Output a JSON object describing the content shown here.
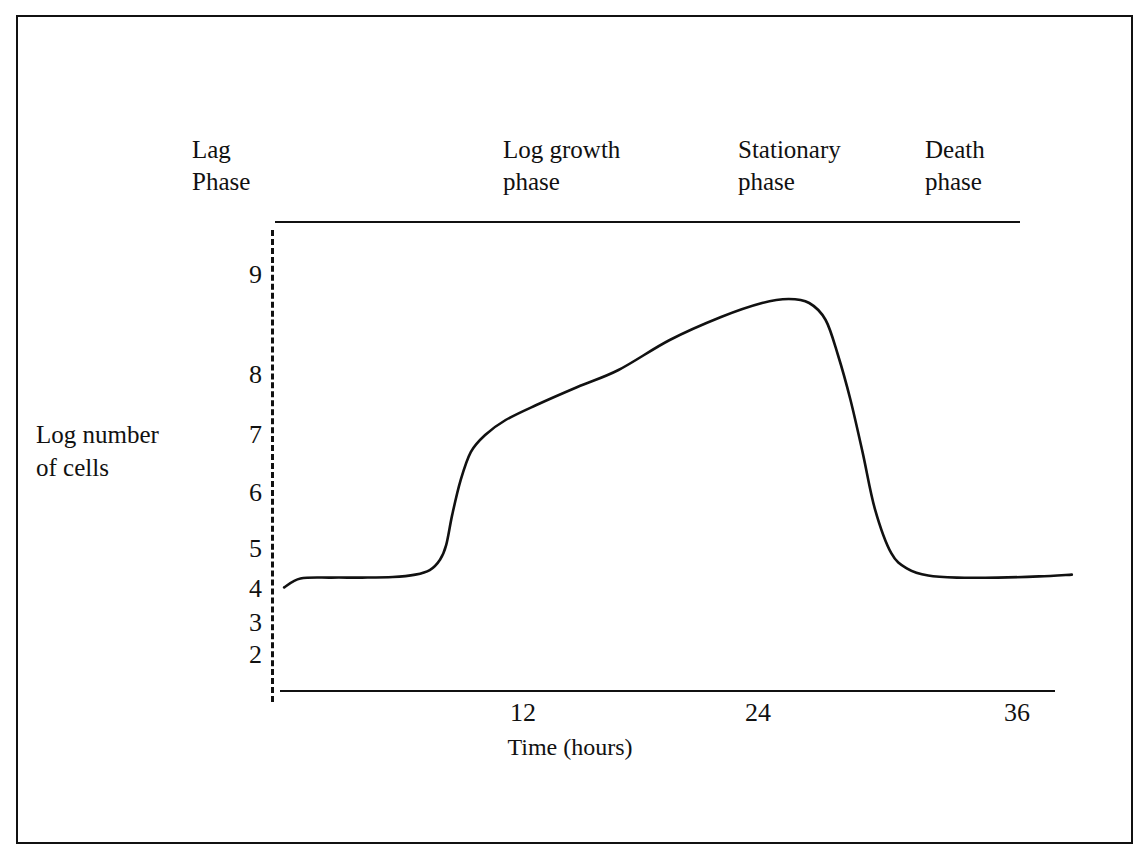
{
  "figure": {
    "kind": "bacterial-growth-curve-diagram",
    "background_color": "#ffffff",
    "ink_color": "#111111",
    "frame": "solid rectangular border"
  },
  "phase_labels": [
    {
      "name": "lag",
      "text": "Lag\nPhase"
    },
    {
      "name": "log-growth",
      "text": "Log growth\nphase"
    },
    {
      "name": "stationary",
      "text": "Stationary\nphase"
    },
    {
      "name": "death",
      "text": "Death\nphase"
    }
  ],
  "axes": {
    "y_title": "Log number\nof cells",
    "x_title": "Time (hours)",
    "y_ticks": [
      "9",
      "8",
      "7",
      "6",
      "5",
      "4",
      "3",
      "2"
    ],
    "x_ticks": [
      "12",
      "24",
      "36"
    ],
    "y_axis_style": "dashed",
    "x_axis_style": "solid"
  },
  "chart_data": {
    "type": "line",
    "title": "",
    "subtitle": "",
    "xlabel": "Time (hours)",
    "ylabel": "Log number of cells",
    "xlim": [
      0,
      39
    ],
    "ylim": [
      1.6,
      9.5
    ],
    "grid": false,
    "legend": "none",
    "annotations": [
      {
        "label": "Lag\nPhase",
        "x_range": [
          0,
          7
        ]
      },
      {
        "label": "Log growth\nphase",
        "x_range": [
          7,
          14
        ]
      },
      {
        "label": "Stationary\nphase",
        "x_range": [
          14,
          27
        ]
      },
      {
        "label": "Death\nphase",
        "x_range": [
          27,
          39
        ]
      }
    ],
    "x_tick_values": [
      12,
      24,
      36
    ],
    "y_tick_values": [
      2,
      3,
      4,
      5,
      6,
      7,
      8,
      9
    ],
    "series": [
      {
        "name": "Log number of cells",
        "x": [
          0.2,
          1.0,
          2.5,
          4.0,
          5.5,
          6.6,
          7.3,
          7.8,
          8.1,
          8.4,
          8.8,
          9.3,
          10.0,
          11.0,
          12.5,
          14.5,
          16.5,
          19.0,
          21.5,
          23.5,
          24.8,
          25.8,
          26.6,
          27.2,
          27.8,
          28.4,
          29.0,
          29.8,
          30.6,
          31.6,
          33.0,
          35.0,
          37.0,
          38.6
        ],
        "y": [
          3.55,
          3.85,
          3.88,
          3.88,
          3.9,
          3.98,
          4.15,
          4.55,
          5.05,
          5.6,
          6.2,
          6.7,
          7.0,
          7.25,
          7.5,
          7.8,
          8.05,
          8.35,
          8.58,
          8.72,
          8.76,
          8.72,
          8.55,
          8.2,
          7.6,
          6.7,
          5.7,
          4.8,
          4.2,
          3.95,
          3.88,
          3.88,
          3.92,
          3.98
        ]
      }
    ]
  }
}
